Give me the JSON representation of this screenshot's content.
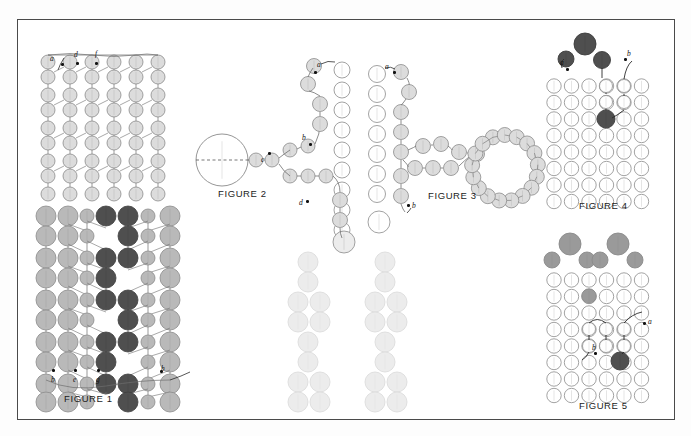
{
  "page": {
    "kind": "patent-figure-sheet",
    "background": "#ffffff",
    "border_color": "#4a4a4a"
  },
  "palette": {
    "outline": "#8a8a8a",
    "outline_dark": "#3d3d3d",
    "fill_empty": "#ffffff",
    "fill_pale": "#ececec",
    "fill_light": "#dcdcdc",
    "fill_mid": "#b9b9b9",
    "fill_gray": "#9a9a9a",
    "fill_dark": "#4f4f4f",
    "leader_line": "#2b2b2b",
    "chain_line": "#6f6f6f",
    "text": "#1c1c1c"
  },
  "figures": [
    {
      "id": "figure-1",
      "caption": "FIGURE 1",
      "top_labels": [
        "a",
        "d",
        "f"
      ],
      "bottom_labels": [
        "b",
        "e",
        "g",
        "h"
      ],
      "columns": 6,
      "description": "Dense woven lattice of beads with light and dark columns"
    },
    {
      "id": "figure-2",
      "caption": "FIGURE 2",
      "labels": [
        "a",
        "b",
        "c",
        "d"
      ],
      "has_large_circle": true,
      "description": "Large circle on left joined by bead chains branching to a vertical bead column"
    },
    {
      "id": "figure-3",
      "caption": "FIGURE 3",
      "labels": [
        "a",
        "b"
      ],
      "has_loop": true,
      "loop_beads": 17,
      "description": "Bead chain forming a closed loop at right, branching from a vertical bead column"
    },
    {
      "id": "figure-4",
      "caption": "FIGURE 4",
      "labels": [
        "a",
        "b"
      ],
      "description": "Open bead grid with dark cluster at top and traced path"
    },
    {
      "id": "figure-5",
      "caption": "FIGURE 5",
      "labels": [
        "a",
        "b"
      ],
      "description": "Open bead grid with two gray triangular clusters at top and traced path at lower right"
    }
  ]
}
